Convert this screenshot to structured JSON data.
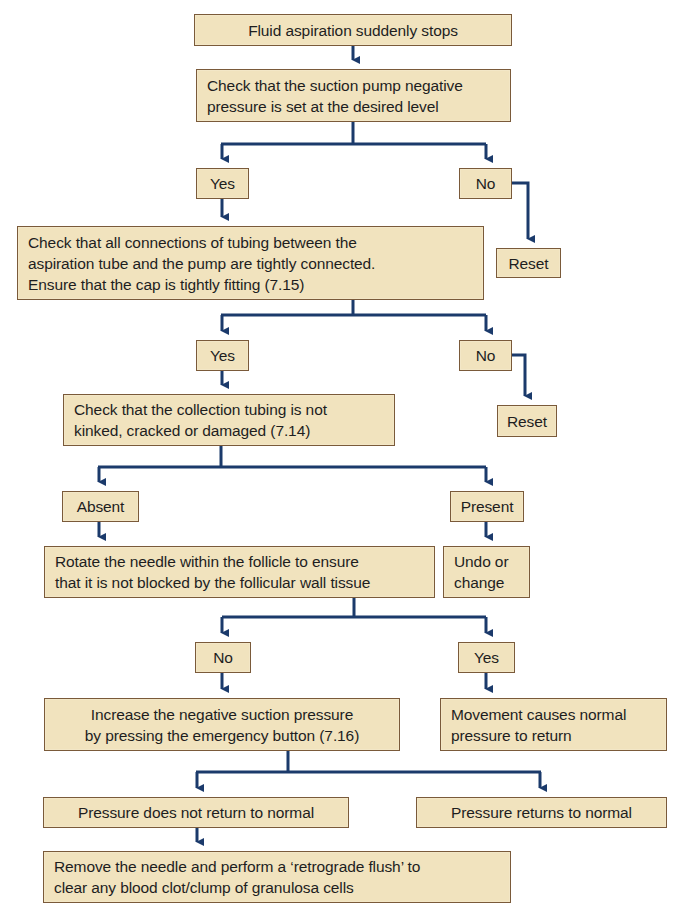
{
  "colors": {
    "box_fill": "#f1e3be",
    "box_border": "#7a5a3a",
    "arrow": "#1b3a6b",
    "background": "#ffffff"
  },
  "nodes": {
    "start": "Fluid aspiration suddenly stops",
    "check_pump": "Check that the suction pump negative\npressure is set at the desired level",
    "pump_yes": "Yes",
    "pump_no": "No",
    "pump_reset": "Reset",
    "check_connections": "Check that all connections of tubing between the\naspiration tube and the pump are tightly connected.\nEnsure that the cap is tightly fitting (7.15)",
    "connections_yes": "Yes",
    "connections_no": "No",
    "connections_reset": "Reset",
    "check_tubing": "Check that the collection tubing is not\nkinked, cracked or damaged (7.14)",
    "tubing_absent": "Absent",
    "tubing_present": "Present",
    "rotate_needle": "Rotate the needle within the follicle to ensure\nthat it is not blocked by the follicular wall tissue",
    "undo_change": "Undo or\nchange",
    "rotate_no": "No",
    "rotate_yes": "Yes",
    "increase_pressure": "Increase the negative suction pressure\nby pressing the emergency button (7.16)",
    "movement_normal": "Movement causes normal\npressure to return",
    "pressure_not_normal": "Pressure does not return to normal",
    "pressure_normal": "Pressure returns to normal",
    "remove_needle": "Remove the needle and perform a ‘retrograde flush’ to\nclear any blood clot/clump of granulosa cells"
  }
}
